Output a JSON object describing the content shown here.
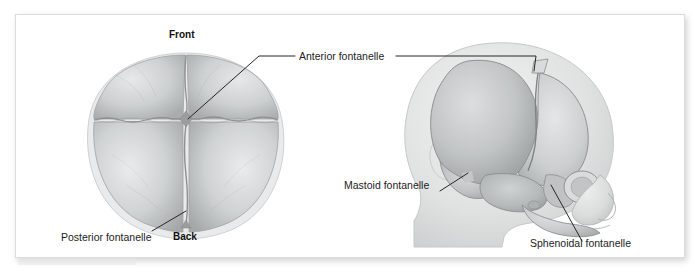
{
  "figure": {
    "type": "anatomical-illustration",
    "background_color": "#ffffff",
    "card_color": "#ffffff",
    "line_color": "#262626",
    "bone_fill": "#b9bcbd",
    "bone_fill_light": "#d3d6d7",
    "head_fill": "#e3e4e5",
    "panels": [
      {
        "name": "superior-view",
        "description": "Top (superior) view of neonatal skull showing frontal and parietal bones separated by sutures"
      },
      {
        "name": "lateral-view",
        "description": "Side (lateral) profile view of infant head showing skull bones through translucent soft tissue"
      }
    ]
  },
  "labels": {
    "anterior_fontanelle": "Anterior fontanelle",
    "posterior_fontanelle": "Posterior fontanelle",
    "mastoid_fontanelle": "Mastoid fontanelle",
    "sphenoidal_fontanelle": "Sphenoidal fontanelle"
  },
  "orientation": {
    "front": "Front",
    "back": "Back"
  },
  "artifacts": {
    "ghost_text_left": "· · ·  ·· ·  ···· ·",
    "ghost_text_right": "·  ·    ·   ·       ·      ·"
  }
}
